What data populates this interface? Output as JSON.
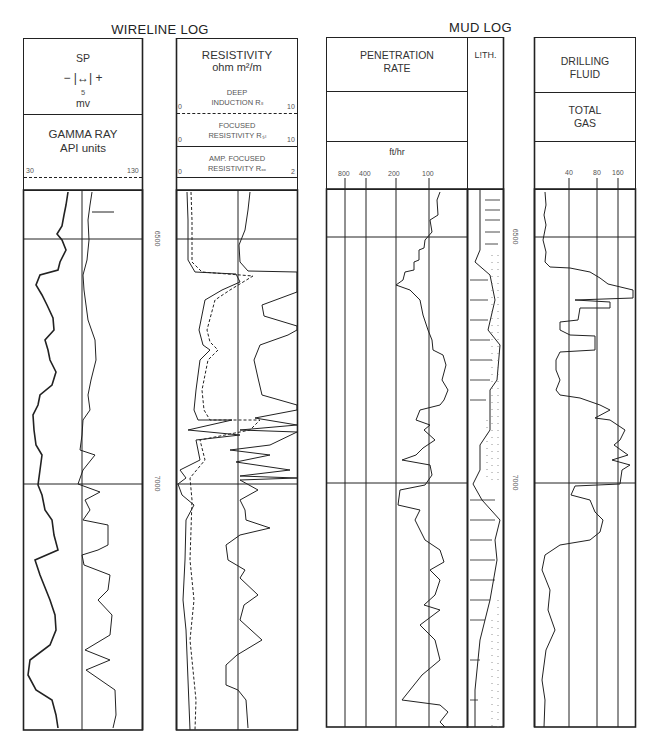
{
  "wireline": {
    "title": "WIRELINE LOG",
    "sp": {
      "label": "SP",
      "scale_symbol": "− |↔| +",
      "scale_value": "5",
      "unit": "mv"
    },
    "gamma": {
      "label": "GAMMA RAY",
      "unit": "API units",
      "min": "30",
      "max": "130"
    },
    "resistivity": {
      "label": "RESISTIVITY",
      "unit": "ohm m²/m",
      "deep": {
        "line1": "DEEP",
        "line2": "INDUCTION Rₗₗ",
        "min": "0",
        "max": "10"
      },
      "focused": {
        "line1": "FOCUSED",
        "line2": "RESISTIVITY Rₛₗ",
        "min": "0",
        "max": "10"
      },
      "amp": {
        "line1": "AMP. FOCUSED",
        "line2": "RESISTIVITY Rₓₓ",
        "min": "0",
        "max": "2"
      }
    },
    "depths": [
      "6500",
      "7000"
    ]
  },
  "mudlog": {
    "title": "MUD LOG",
    "penetration": {
      "line1": "PENETRATION",
      "line2": "RATE",
      "unit": "ft/hr",
      "ticks": [
        "800",
        "400",
        "200",
        "100"
      ]
    },
    "lith": "L!TH.",
    "drilling": {
      "line1": "DRILLING",
      "line2": "FLUID"
    },
    "gas": {
      "line1": "TOTAL",
      "line2": "GAS",
      "ticks": [
        "40",
        "80",
        "160"
      ]
    },
    "depths": [
      "6500",
      "7000"
    ]
  }
}
